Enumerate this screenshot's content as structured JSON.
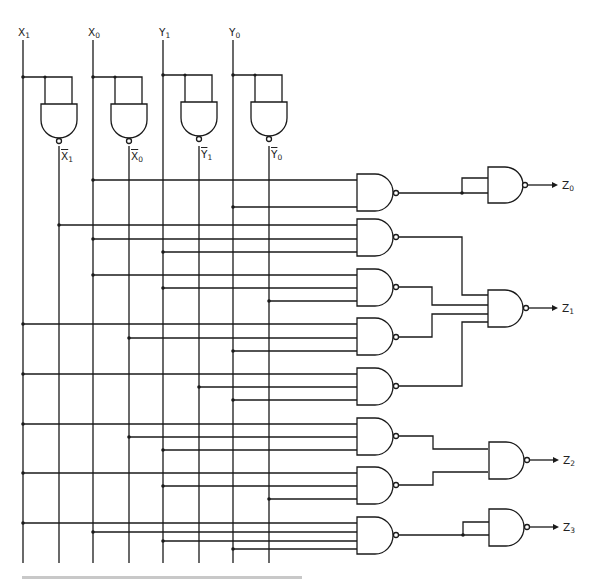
{
  "diagram": {
    "type": "logic-circuit",
    "inputs": [
      {
        "id": "X1",
        "base": "X",
        "sub": "1"
      },
      {
        "id": "X0",
        "base": "X",
        "sub": "0"
      },
      {
        "id": "Y1",
        "base": "Y",
        "sub": "1"
      },
      {
        "id": "Y0",
        "base": "Y",
        "sub": "0"
      }
    ],
    "inverted_inputs": [
      {
        "id": "X1_bar",
        "base": "X",
        "sub": "1"
      },
      {
        "id": "X0_bar",
        "base": "X",
        "sub": "0"
      },
      {
        "id": "Y1_bar",
        "base": "Y",
        "sub": "1"
      },
      {
        "id": "Y0_bar",
        "base": "Y",
        "sub": "0"
      }
    ],
    "outputs": [
      {
        "id": "Z0",
        "base": "Z",
        "sub": "0"
      },
      {
        "id": "Z1",
        "base": "Z",
        "sub": "1"
      },
      {
        "id": "Z2",
        "base": "Z",
        "sub": "2"
      },
      {
        "id": "Z3",
        "base": "Z",
        "sub": "3"
      }
    ],
    "first_level_gates": [
      {
        "id": "G1",
        "inputs": [
          "X0",
          "Y0"
        ],
        "feeds": "Z0"
      },
      {
        "id": "G2",
        "inputs": [
          "X1_bar",
          "X0",
          "Y1"
        ],
        "feeds": "Z1"
      },
      {
        "id": "G3",
        "inputs": [
          "X0",
          "Y1",
          "Y0_bar"
        ],
        "feeds": "Z1"
      },
      {
        "id": "G4",
        "inputs": [
          "X1",
          "X0_bar",
          "Y0"
        ],
        "feeds": "Z1"
      },
      {
        "id": "G5",
        "inputs": [
          "X1",
          "Y1_bar",
          "Y0"
        ],
        "feeds": "Z1"
      },
      {
        "id": "G6",
        "inputs": [
          "X1",
          "X0_bar",
          "Y1"
        ],
        "feeds": "Z2"
      },
      {
        "id": "G7",
        "inputs": [
          "X1",
          "Y1",
          "Y0_bar"
        ],
        "feeds": "Z2"
      },
      {
        "id": "G8",
        "inputs": [
          "X1",
          "X0",
          "Y1",
          "Y0"
        ],
        "feeds": "Z3"
      }
    ]
  }
}
